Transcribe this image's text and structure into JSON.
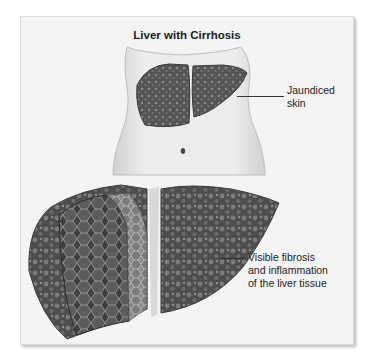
{
  "figure": {
    "title": "Liver with Cirrhosis",
    "labels": {
      "jaundiced": [
        "Jaundiced",
        "skin"
      ],
      "fibrosis": [
        "Visible fibrosis",
        "and inflammation",
        "of the liver tissue"
      ]
    },
    "illustrations": {
      "torso": "torso-with-cirrhotic-liver-illustration",
      "liver": "cross-section-cirrhotic-liver-illustration"
    },
    "colors": {
      "panel_bg": "#f3f3f3",
      "liver_dark": "#4a4a4a",
      "liver_mid": "#6e6e6e",
      "skin": "#e8e8e8"
    }
  }
}
